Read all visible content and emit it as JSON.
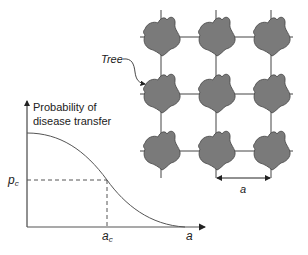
{
  "diagram": {
    "grid": {
      "rows": 3,
      "cols": 3,
      "tree_label": "Tree",
      "spacing_label": "a",
      "tree_fill": "#7a7a7a",
      "line_color": "#444444"
    },
    "graph": {
      "y_axis_label_line1": "Probability of",
      "y_axis_label_line2": "disease transfer",
      "x_axis_label": "a",
      "critical_prob_label": "p",
      "critical_prob_sub": "c",
      "critical_dist_label": "a",
      "critical_dist_sub": "c",
      "curve_color": "#555555"
    }
  }
}
